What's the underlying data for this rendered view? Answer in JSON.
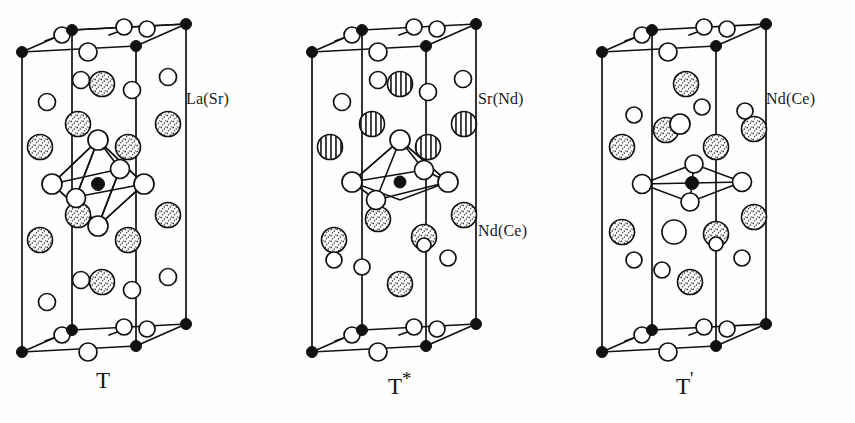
{
  "figure": {
    "background": "#fefefe",
    "ink": "#111111"
  },
  "structures": [
    {
      "id": "T",
      "caption": "T",
      "caption_superscript": "",
      "coordination": "octahedron",
      "coordination_label": "CuO6 octahedron",
      "labels": [
        {
          "text": "La(Sr)",
          "atom": "stippled-sphere"
        }
      ],
      "atom_legend": {
        "stippled": "La(Sr)",
        "open": "O",
        "filled": "Cu"
      },
      "origin_x": 10
    },
    {
      "id": "T*",
      "caption": "T",
      "caption_superscript": "*",
      "coordination": "square-pyramid",
      "coordination_label": "CuO5 square pyramid",
      "labels": [
        {
          "text": "Sr(Nd)",
          "atom": "hatched-sphere"
        },
        {
          "text": "Nd(Ce)",
          "atom": "stippled-sphere"
        }
      ],
      "atom_legend": {
        "hatched": "Sr(Nd)",
        "stippled": "Nd(Ce)",
        "open": "O",
        "filled": "Cu"
      },
      "origin_x": 300
    },
    {
      "id": "T'",
      "caption": "T",
      "caption_superscript": "'",
      "coordination": "square-planar",
      "coordination_label": "CuO4 square plane",
      "labels": [
        {
          "text": "Nd(Ce)",
          "atom": "stippled-sphere"
        }
      ],
      "atom_legend": {
        "stippled": "Nd(Ce)",
        "open": "O",
        "filled": "Cu"
      },
      "origin_x": 590
    }
  ],
  "captions": {
    "t": "T",
    "tstar_base": "T",
    "tstar_sup": "*",
    "tprime_base": "T",
    "tprime_sup": "'"
  },
  "labels": {
    "la_sr": "La(Sr)",
    "sr_nd": "Sr(Nd)",
    "nd_ce_mid": "Nd(Ce)",
    "nd_ce_right": "Nd(Ce)"
  }
}
